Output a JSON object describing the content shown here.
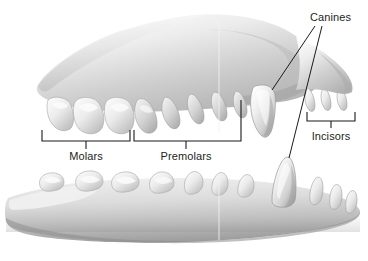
{
  "figure": {
    "background_color": "#ffffff",
    "label_color": "#231f20",
    "line_color": "#1a1a1a",
    "tooth_fill_light": "#f2f2f2",
    "tooth_fill_mid": "#d8d8d8",
    "jaw_fill_light": "#ededed",
    "jaw_fill_mid": "#c9c9c9",
    "jaw_fill_dark": "#a8a8a8"
  },
  "labels": {
    "canines": "Canines",
    "incisors": "Incisors",
    "molars": "Molars",
    "premolars": "Premolars"
  },
  "structures": {
    "upper_jaw": "upper-jaw-maxilla",
    "lower_jaw": "lower-jaw-mandible",
    "upper_canine": "upper-canine-tooth",
    "lower_canine": "lower-canine-tooth",
    "upper_incisors": "upper-incisor-teeth",
    "lower_incisors": "lower-incisor-teeth",
    "upper_premolars": "upper-premolar-teeth",
    "lower_premolars": "lower-premolar-teeth",
    "upper_molars": "upper-molar-teeth",
    "lower_molars": "lower-molar-teeth"
  }
}
